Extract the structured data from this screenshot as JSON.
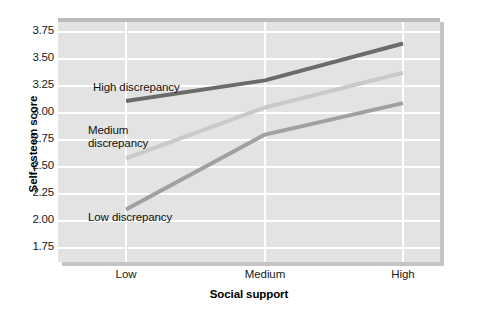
{
  "chart_data": {
    "type": "line",
    "title": "",
    "xlabel": "Social support",
    "ylabel": "Self-esteem score",
    "categories": [
      "Low",
      "Medium",
      "High"
    ],
    "ylim": [
      1.625,
      3.875
    ],
    "yticks": [
      3.75,
      3.5,
      3.25,
      3.0,
      2.75,
      2.5,
      2.25,
      2.0,
      1.75
    ],
    "ytick_labels": [
      "3.75",
      "3.50",
      "3.25",
      "3.00",
      "2.75",
      "2.50",
      "2.25",
      "2.00",
      "1.75"
    ],
    "grid": true,
    "legend_position": "inline-annotations",
    "series": [
      {
        "name": "High discrepancy",
        "label": "High discrepancy",
        "color": "#6b6b6b",
        "values": [
          3.11,
          3.3,
          3.64
        ]
      },
      {
        "name": "Medium discrepancy",
        "label": "Medium\ndiscrepancy",
        "color": "#c9c9c9",
        "values": [
          2.58,
          3.05,
          3.37
        ]
      },
      {
        "name": "Low discrepancy",
        "label": "Low discrepancy",
        "color": "#a0a0a0",
        "values": [
          2.11,
          2.8,
          3.09
        ]
      }
    ],
    "annotations": [
      {
        "text": "High discrepancy",
        "x_px": 93,
        "y_px": 81
      },
      {
        "text": "Medium\ndiscrepancy",
        "x_px": 88,
        "y_px": 124
      },
      {
        "text": "Low discrepancy",
        "x_px": 88,
        "y_px": 211
      }
    ],
    "plot_background": "#e3e3e3",
    "grid_color": "#ffffff"
  }
}
